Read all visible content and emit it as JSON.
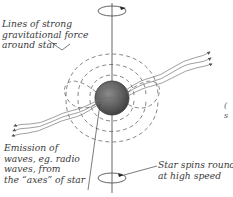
{
  "diagram": {
    "labels": {
      "gravity": {
        "lines": [
          "Lines of strong",
          "gravitational force",
          "around star"
        ]
      },
      "emission": {
        "lines": [
          "Emission of",
          "waves, eg. radio",
          "waves, from",
          "the “axes” of star"
        ]
      },
      "spin": {
        "lines": [
          "Star spins round",
          "at high speed"
        ]
      }
    },
    "edge_fragment": {
      "lines": [
        "(",
        "s"
      ]
    },
    "colors": {
      "star_fill": "#6e6e6e",
      "star_dark": "#4a4a4a",
      "line": "#555555",
      "dashed_line": "#6a6a6a",
      "text": "#3a3a3a",
      "background": "#ffffff"
    },
    "elements": {
      "spin_axis": "vertical axis line through star",
      "top_spin_indicator": "ellipse with arrow showing rotation",
      "bottom_spin_indicator": "ellipse with arrow showing rotation",
      "star": "dark shaded sphere at center",
      "field_lines": "dashed loops around star (dipole pattern)",
      "emission_beams": "wavy lines radiating from star to upper-right and lower-left with arrowheads"
    }
  }
}
